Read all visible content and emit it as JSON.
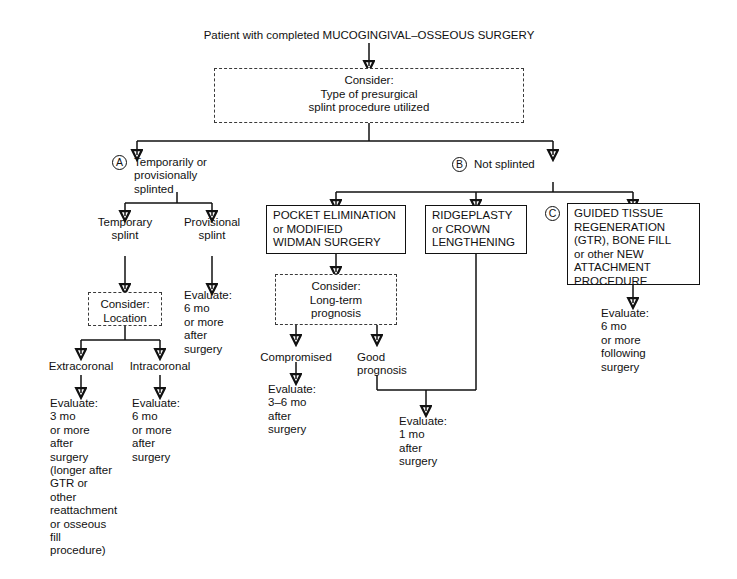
{
  "diagram": {
    "title": "Patient with completed MUCOGINGIVAL–OSSEOUS SURGERY",
    "root_consider": "Consider:\n    Type of presurgical\n    splint procedure utilized",
    "branch_a": {
      "marker": "A",
      "label": "Temporarily or\nprovisionally\nsplinted",
      "children": {
        "temporary_splint": "Temporary\nsplint",
        "provisional_splint": "Provisional\nsplint",
        "provisional_outcome": "Evaluate:\n   6 mo\n   or more\n   after\n   surgery",
        "consider_location": "Consider:\n   Location",
        "extracoronal": "Extracoronal",
        "intracoronal": "Intracoronal",
        "extracoronal_outcome": "Evaluate:\n   3 mo\n   or more\n   after\n   surgery\n   (longer after\n   GTR or\n   other\n   reattachment\n   or osseous\n   fill\n   procedure)",
        "intracoronal_outcome": "Evaluate:\n   6 mo\n   or more\n   after\n   surgery"
      }
    },
    "branch_b": {
      "marker": "B",
      "label": "Not splinted",
      "pocket_box": "POCKET ELIMINATION\nor MODIFIED\nWIDMAN SURGERY",
      "pocket_consider": "Consider:\n    Long-term\n    prognosis",
      "compromised": "Compromised",
      "good_prognosis": "Good\nprognosis",
      "compromised_outcome": "Evaluate:\n   3–6 mo\n   after\n   surgery",
      "ridgeplasty_box": "RIDGEPLASTY\nor CROWN\nLENGTHENING",
      "merged_outcome": "Evaluate:\n   1 mo\n   after\n   surgery"
    },
    "branch_c": {
      "marker": "C",
      "gtr_box": "GUIDED TISSUE\nREGENERATION\n(GTR), BONE FILL\nor other NEW\nATTACHMENT\nPROCEDURE",
      "gtr_outcome": "Evaluate:\n   6 mo\n   or more\n   following\n   surgery"
    }
  }
}
